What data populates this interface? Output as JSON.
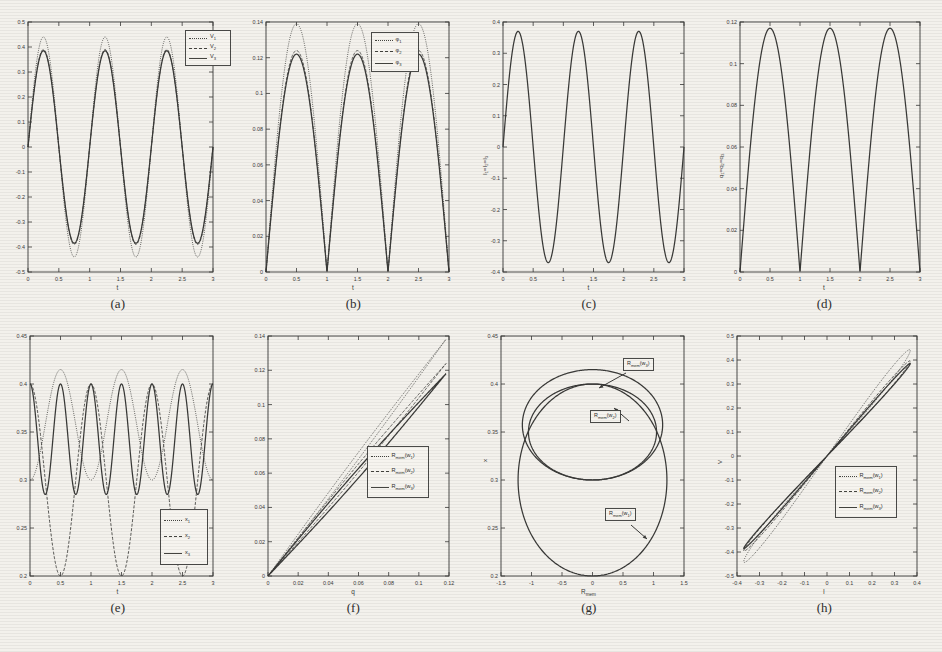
{
  "figure": {
    "background_color": "#f3f1ec",
    "ink_color": "#3a3a38",
    "panel_count": 8
  },
  "panels": [
    {
      "id": "a",
      "caption": "(a)",
      "xlabel": "t",
      "ylabel": "",
      "xticks": [
        "0",
        "0.5",
        "1",
        "1.5",
        "2",
        "2.5",
        "3"
      ],
      "yticks": [
        "-0.5",
        "-0.4",
        "-0.3",
        "-0.2",
        "-0.1",
        "0",
        "0.1",
        "0.2",
        "0.3",
        "0.4",
        "0.5"
      ],
      "legend": [
        {
          "label": "V",
          "sub": "1",
          "style": "dotted"
        },
        {
          "label": "V",
          "sub": "2",
          "style": "dashed"
        },
        {
          "label": "V",
          "sub": "3",
          "style": "solid"
        }
      ]
    },
    {
      "id": "b",
      "caption": "(b)",
      "xlabel": "t",
      "ylabel": "",
      "xticks": [
        "0",
        "0.5",
        "1",
        "1.5",
        "2",
        "2.5",
        "3"
      ],
      "yticks": [
        "0",
        "0.02",
        "0.04",
        "0.06",
        "0.08",
        "0.1",
        "0.12",
        "0.14"
      ],
      "legend": [
        {
          "label": "φ",
          "sub": "1",
          "style": "dotted"
        },
        {
          "label": "φ",
          "sub": "2",
          "style": "dashed"
        },
        {
          "label": "φ",
          "sub": "3",
          "style": "solid"
        }
      ]
    },
    {
      "id": "c",
      "caption": "(c)",
      "xlabel": "t",
      "ylabel": "I₁=I₂=I₃",
      "xticks": [
        "0",
        "0.5",
        "1",
        "1.5",
        "2",
        "2.5",
        "3"
      ],
      "yticks": [
        "-0.4",
        "-0.3",
        "-0.2",
        "-0.1",
        "0",
        "0.1",
        "0.2",
        "0.3",
        "0.4"
      ],
      "legend": []
    },
    {
      "id": "d",
      "caption": "(d)",
      "xlabel": "t",
      "ylabel": "q₁=q₂=q₃",
      "xticks": [
        "0",
        "0.5",
        "1",
        "1.5",
        "2",
        "2.5",
        "3"
      ],
      "yticks": [
        "0",
        "0.02",
        "0.04",
        "0.06",
        "0.08",
        "0.1",
        "0.12"
      ],
      "legend": []
    },
    {
      "id": "e",
      "caption": "(e)",
      "xlabel": "t",
      "ylabel": "",
      "xticks": [
        "0",
        "0.5",
        "1",
        "1.5",
        "2",
        "2.5",
        "3"
      ],
      "yticks": [
        "0.2",
        "0.25",
        "0.3",
        "0.35",
        "0.4",
        "0.45"
      ],
      "legend": [
        {
          "label": "x",
          "sub": "1",
          "style": "dotted"
        },
        {
          "label": "x",
          "sub": "2",
          "style": "dashed"
        },
        {
          "label": "x",
          "sub": "3",
          "style": "solid"
        }
      ]
    },
    {
      "id": "f",
      "caption": "(f)",
      "xlabel": "q",
      "ylabel": "",
      "xticks": [
        "0",
        "0.02",
        "0.04",
        "0.06",
        "0.08",
        "0.1",
        "0.12"
      ],
      "yticks": [
        "0",
        "0.02",
        "0.04",
        "0.06",
        "0.08",
        "0.1",
        "0.12",
        "0.14"
      ],
      "legend": [
        {
          "label": "R",
          "sub": "mem",
          "arg": "(w₁)",
          "style": "dotted"
        },
        {
          "label": "R",
          "sub": "mem",
          "arg": "(w₂)",
          "style": "dashed"
        },
        {
          "label": "R",
          "sub": "mem",
          "arg": "(w₃)",
          "style": "solid"
        }
      ]
    },
    {
      "id": "g",
      "caption": "(g)",
      "xlabel": "R_mem",
      "ylabel": "x",
      "xticks": [
        "-1.5",
        "-1",
        "-0.5",
        "0",
        "0.5",
        "1",
        "1.5"
      ],
      "yticks": [
        "0.2",
        "0.25",
        "0.3",
        "0.35",
        "0.4",
        "0.45"
      ],
      "annotations": [
        {
          "text": "R",
          "sub": "mem",
          "arg": "(w₃)"
        },
        {
          "text": "R",
          "sub": "mem",
          "arg": "(w₂)"
        },
        {
          "text": "R",
          "sub": "mem",
          "arg": "(w₁)"
        }
      ],
      "legend": []
    },
    {
      "id": "h",
      "caption": "(h)",
      "xlabel": "I",
      "ylabel": "V",
      "xticks": [
        "-0.4",
        "-0.3",
        "-0.2",
        "-0.1",
        "0",
        "0.1",
        "0.2",
        "0.3",
        "0.4"
      ],
      "yticks": [
        "-0.5",
        "-0.4",
        "-0.3",
        "-0.2",
        "-0.1",
        "0",
        "0.1",
        "0.2",
        "0.3",
        "0.4",
        "0.5"
      ],
      "legend": [
        {
          "label": "R",
          "sub": "mem",
          "arg": "(w₁)",
          "style": "dotted"
        },
        {
          "label": "R",
          "sub": "mem",
          "arg": "(w₂)",
          "style": "dashed"
        },
        {
          "label": "R",
          "sub": "mem",
          "arg": "(w₃)",
          "style": "solid"
        }
      ]
    }
  ],
  "chart_data": [
    {
      "id": "a",
      "type": "line",
      "title": "",
      "xlabel": "t",
      "ylabel": "V",
      "xlim": [
        0,
        3
      ],
      "ylim": [
        -0.5,
        0.5
      ],
      "grid": false,
      "legend_position": "top-right",
      "description": "Three near-coincident sinusoidal voltage waveforms of period 1, V1 peaking at 0.44, V2 and V3 peaking at 0.39",
      "series": [
        {
          "name": "V₁",
          "style": "dotted",
          "amplitude": 0.44,
          "period": 1.0,
          "phase_shift": 0.0
        },
        {
          "name": "V₂",
          "style": "dashed",
          "amplitude": 0.39,
          "period": 1.0,
          "phase_shift": 0.0
        },
        {
          "name": "V₃",
          "style": "solid",
          "amplitude": 0.385,
          "period": 1.0,
          "phase_shift": 0.0
        }
      ]
    },
    {
      "id": "b",
      "type": "line",
      "title": "",
      "xlabel": "t",
      "ylabel": "φ",
      "xlim": [
        0,
        3
      ],
      "ylim": [
        0,
        0.14
      ],
      "grid": false,
      "legend_position": "top-right",
      "description": "Three rectified-sine flux waveforms of period 1 touching zero at integer t; φ₁ peaks 0.139, φ₂ 0.124, φ₃ 0.122",
      "series": [
        {
          "name": "φ₁",
          "style": "dotted",
          "amplitude": 0.139,
          "period": 1.0
        },
        {
          "name": "φ₂",
          "style": "dashed",
          "amplitude": 0.124,
          "period": 1.0
        },
        {
          "name": "φ₃",
          "style": "solid",
          "amplitude": 0.122,
          "period": 1.0
        }
      ]
    },
    {
      "id": "c",
      "type": "line",
      "title": "",
      "xlabel": "t",
      "ylabel": "I₁=I₂=I₃",
      "xlim": [
        0,
        3
      ],
      "ylim": [
        -0.4,
        0.4
      ],
      "grid": false,
      "legend_position": "none",
      "description": "Single sinusoidal current of period 1 with amplitude 0.37",
      "series": [
        {
          "name": "I₁=I₂=I₃",
          "style": "solid",
          "amplitude": 0.37,
          "period": 1.0
        }
      ]
    },
    {
      "id": "d",
      "type": "line",
      "title": "",
      "xlabel": "t",
      "ylabel": "q₁=q₂=q₃",
      "xlim": [
        0,
        3
      ],
      "ylim": [
        0,
        0.12
      ],
      "grid": false,
      "legend_position": "none",
      "description": "Single rectified-sine charge waveform of period 1 with peak 0.117 touching zero at integer t",
      "series": [
        {
          "name": "q₁=q₂=q₃",
          "style": "solid",
          "amplitude": 0.117,
          "period": 1.0
        }
      ]
    },
    {
      "id": "e",
      "type": "line",
      "title": "",
      "xlabel": "t",
      "ylabel": "x",
      "xlim": [
        0,
        3
      ],
      "ylim": [
        0.2,
        0.45
      ],
      "grid": false,
      "legend_position": "bottom-right",
      "description": "Three state variables oscillating: x1 between 0.30 and 0.415 with period 1 (phase 0.5), x2 between 0.20 and 0.40 with period 0.5, x3 between 0.285 and 0.40 period 0.5",
      "series": [
        {
          "name": "x₁",
          "style": "dotted",
          "min": 0.3,
          "max": 0.415,
          "period": 1.0
        },
        {
          "name": "x₂",
          "style": "dashed",
          "min": 0.2,
          "max": 0.4,
          "period": 1.0
        },
        {
          "name": "x₃",
          "style": "solid",
          "min": 0.285,
          "max": 0.4,
          "period": 0.5
        }
      ]
    },
    {
      "id": "f",
      "type": "line",
      "title": "",
      "xlabel": "q",
      "ylabel": "R_mem",
      "xlim": [
        0,
        0.12
      ],
      "ylim": [
        0,
        0.14
      ],
      "grid": false,
      "legend_position": "center-right",
      "description": "Three near-linear loops of memristance versus charge; top branch slope ~1.17, lower branches slope ~1.02",
      "series": [
        {
          "name": "R_mem(w₁)",
          "style": "dotted",
          "slope": 1.17
        },
        {
          "name": "R_mem(w₂)",
          "style": "dashed",
          "slope": 1.05
        },
        {
          "name": "R_mem(w₃)",
          "style": "solid",
          "slope": 1.0
        }
      ]
    },
    {
      "id": "g",
      "type": "line",
      "title": "",
      "xlabel": "R_mem",
      "ylabel": "x",
      "xlim": [
        -1.5,
        1.5
      ],
      "ylim": [
        0.2,
        0.45
      ],
      "grid": false,
      "legend_position": "annotations",
      "description": "Two overlapping closed ellipse-like orbits in the R_mem-x plane; upper loop spans x 0.30-0.415 width 1.2, lower loop spans x 0.20-0.40 width 1.25",
      "series": [
        {
          "name": "R_mem(w₃)",
          "cx": 0.0,
          "cy": 0.3575,
          "rx": 1.15,
          "ry": 0.0575
        },
        {
          "name": "R_mem(w₂)",
          "cx": 0.0,
          "cy": 0.35,
          "rx": 1.05,
          "ry": 0.05
        },
        {
          "name": "R_mem(w₁)",
          "cx": 0.0,
          "cy": 0.3,
          "rx": 1.22,
          "ry": 0.1
        }
      ]
    },
    {
      "id": "h",
      "type": "line",
      "title": "",
      "xlabel": "I",
      "ylabel": "V",
      "xlim": [
        -0.4,
        0.4
      ],
      "ylim": [
        -0.5,
        0.5
      ],
      "grid": false,
      "legend_position": "center-right",
      "description": "Three pinched hysteresis (I-V) loops centred at the origin; extremes at I=±0.37, V=±0.44 for the widest loop",
      "series": [
        {
          "name": "R_mem(w₁)",
          "style": "dotted",
          "i_max": 0.37,
          "v_max": 0.44,
          "loop_width": 0.055
        },
        {
          "name": "R_mem(w₂)",
          "style": "dashed",
          "i_max": 0.37,
          "v_max": 0.395,
          "loop_width": 0.035
        },
        {
          "name": "R_mem(w₃)",
          "style": "solid",
          "i_max": 0.37,
          "v_max": 0.385,
          "loop_width": 0.025
        }
      ]
    }
  ]
}
